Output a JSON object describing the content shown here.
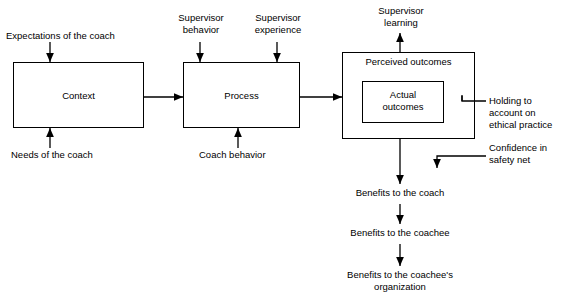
{
  "diagram": {
    "boxes": [
      {
        "id": "context",
        "label": "Context"
      },
      {
        "id": "process",
        "label": "Process"
      },
      {
        "id": "perceived",
        "label": "Perceived outcomes"
      },
      {
        "id": "actual",
        "label": "Actual\noutcomes"
      }
    ],
    "labels": [
      {
        "id": "expectations",
        "text": "Expectations of the coach"
      },
      {
        "id": "needs",
        "text": "Needs of the coach"
      },
      {
        "id": "supervisor-behavior",
        "text": "Supervisor\nbehavior"
      },
      {
        "id": "supervisor-experience",
        "text": "Supervisor\nexperience"
      },
      {
        "id": "coach-behavior",
        "text": "Coach behavior"
      },
      {
        "id": "supervisor-learning",
        "text": "Supervisor\nlearning"
      },
      {
        "id": "holding-to-account",
        "text": "Holding to\naccount on\nethical practice"
      },
      {
        "id": "confidence-safety-net",
        "text": "Confidence in\nsafety net"
      },
      {
        "id": "benefits-coach",
        "text": "Benefits to the coach"
      },
      {
        "id": "benefits-coachee",
        "text": "Benefits to the coachee"
      },
      {
        "id": "benefits-organization",
        "text": "Benefits to the coachee's\norganization"
      }
    ],
    "colors": {
      "stroke": "#000000",
      "background": "#ffffff",
      "text": "#000000"
    }
  }
}
